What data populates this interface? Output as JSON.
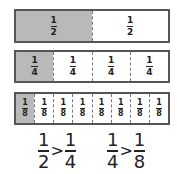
{
  "bars": [
    {
      "name": "halves",
      "segments": [
        {
          "num": "1",
          "den": "2",
          "shaded": true
        },
        {
          "num": "1",
          "den": "2",
          "shaded": false
        }
      ]
    },
    {
      "name": "quarters",
      "segments": [
        {
          "num": "1",
          "den": "4",
          "shaded": true
        },
        {
          "num": "1",
          "den": "4",
          "shaded": false
        },
        {
          "num": "1",
          "den": "4",
          "shaded": false
        },
        {
          "num": "1",
          "den": "4",
          "shaded": false
        }
      ]
    },
    {
      "name": "eighths",
      "segments": [
        {
          "num": "1",
          "den": "8",
          "shaded": true
        },
        {
          "num": "1",
          "den": "8",
          "shaded": false
        },
        {
          "num": "1",
          "den": "8",
          "shaded": false
        },
        {
          "num": "1",
          "den": "8",
          "shaded": false
        },
        {
          "num": "1",
          "den": "8",
          "shaded": false
        },
        {
          "num": "1",
          "den": "8",
          "shaded": false
        },
        {
          "num": "1",
          "den": "8",
          "shaded": false
        },
        {
          "num": "1",
          "den": "8",
          "shaded": false
        }
      ]
    }
  ],
  "comparisons": [
    {
      "left": {
        "num": "1",
        "den": "2"
      },
      "op": ">",
      "right": {
        "num": "1",
        "den": "4"
      }
    },
    {
      "left": {
        "num": "1",
        "den": "4"
      },
      "op": ">",
      "right": {
        "num": "1",
        "den": "8"
      }
    }
  ],
  "colors": {
    "shaded": "#b9b9b9",
    "border": "#555555"
  }
}
